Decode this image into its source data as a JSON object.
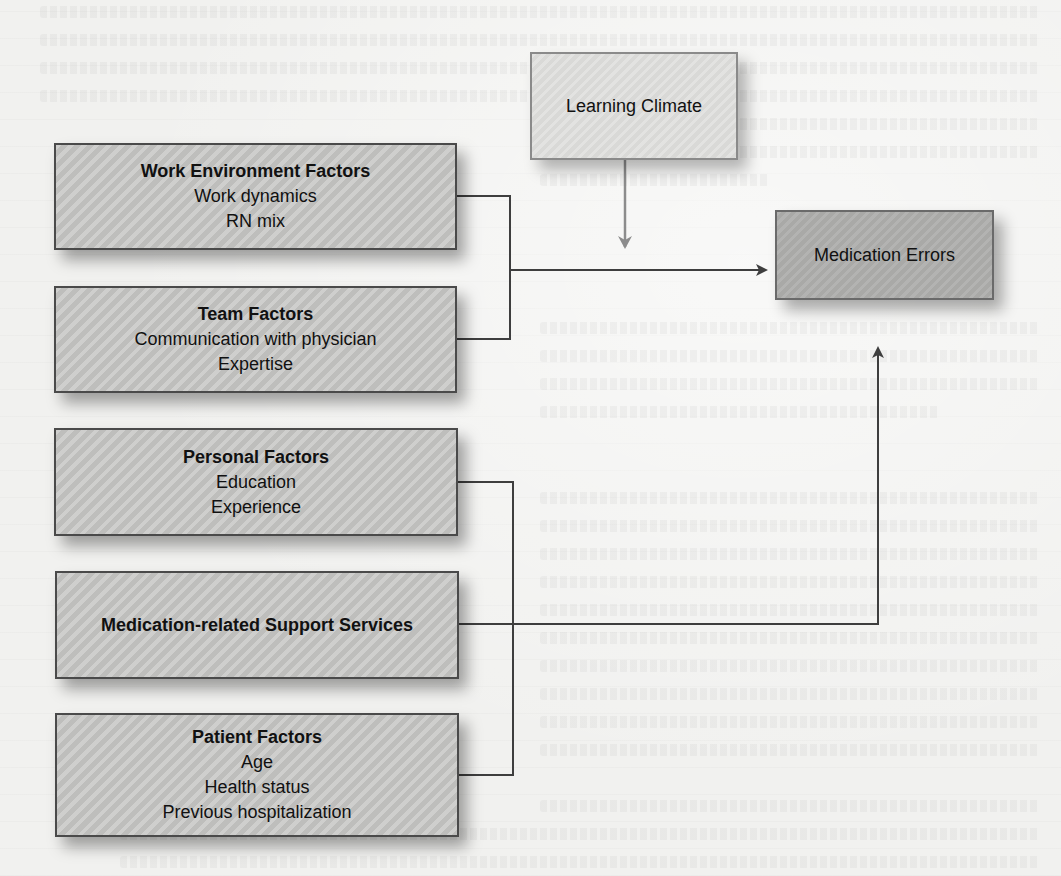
{
  "diagram": {
    "colors": {
      "background": "#f1f1ef",
      "factor_box_fill": "#c4c4c2",
      "learning_box_fill": "#d9d9d7",
      "outcome_box_fill": "#a9a9a7",
      "line": "#3e3e3e",
      "moderator_arrow": "#8c8c8c"
    },
    "factors": [
      {
        "title": "Work Environment Factors",
        "items": [
          "Work dynamics",
          "RN mix"
        ]
      },
      {
        "title": "Team Factors",
        "items": [
          "Communication with physician",
          "Expertise"
        ]
      },
      {
        "title": "Personal Factors",
        "items": [
          "Education",
          "Experience"
        ]
      },
      {
        "title": "Medication-related Support Services",
        "items": []
      },
      {
        "title": "Patient Factors",
        "items": [
          "Age",
          "Health status",
          "Previous hospitalization"
        ]
      }
    ],
    "moderator": {
      "label": "Learning Climate"
    },
    "outcome": {
      "label": "Medication Errors"
    },
    "edges": [
      {
        "from": "Work Environment Factors + Team Factors",
        "to": "Medication Errors",
        "type": "arrow"
      },
      {
        "from": "Learning Climate",
        "to": "Work/Team → Medication Errors path",
        "type": "moderating-arrow"
      },
      {
        "from": "Personal Factors + Medication-related Support Services + Patient Factors",
        "to": "Medication Errors",
        "type": "arrow"
      }
    ]
  }
}
